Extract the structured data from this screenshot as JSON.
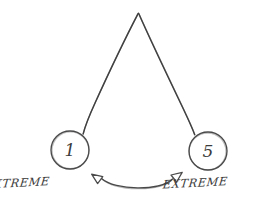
{
  "diagram": {
    "style": "hand-drawn pencil sketch",
    "background_color": "#ffffff",
    "stroke_color": "#3a3a3a",
    "nodes": [
      {
        "id": "left-node",
        "value": "1",
        "label": "EXTREME",
        "cx": 70,
        "cy": 150,
        "r": 19
      },
      {
        "id": "right-node",
        "value": "5",
        "label": "EXTREME",
        "cx": 208,
        "cy": 151,
        "r": 19
      }
    ],
    "apex": {
      "id": "apex-point",
      "x": 138,
      "y": 13
    },
    "connector": {
      "id": "double-arrow",
      "kind": "double-headed-curved-arrow",
      "direction": "bidirectional",
      "arc_bow": "downward"
    }
  }
}
